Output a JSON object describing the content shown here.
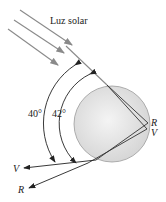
{
  "diagram": {
    "title_label": "Luz solar",
    "angles": {
      "violet": "40°",
      "red": "42°"
    },
    "internal_labels": {
      "red": "R",
      "violet": "V"
    },
    "exit_labels": {
      "violet": "V",
      "red": "R"
    },
    "colors": {
      "sunray": "#8a8a8a",
      "ray": "#333333",
      "droplet_fill": "#e6e6e6",
      "droplet_stroke": "#9a9a9a"
    }
  }
}
